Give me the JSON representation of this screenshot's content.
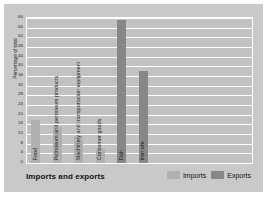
{
  "chart_data": {
    "type": "bar",
    "title": "Imports and exports",
    "xlabel": "",
    "ylabel": "Percentage of total",
    "ylim": [
      0,
      60
    ],
    "grid": true,
    "legend_position": "bottom-right",
    "categories": [
      "Food",
      "Petroleum and petroleum products",
      "Machinery and transportation equipment",
      "Consumer goods",
      "Fish",
      "Iron ore"
    ],
    "series": [
      {
        "name": "Imports",
        "color": "#b0b0b0",
        "values": [
          18,
          15,
          11,
          6,
          null,
          null
        ]
      },
      {
        "name": "Exports",
        "color": "#878787",
        "values": [
          null,
          null,
          null,
          null,
          59,
          38
        ]
      }
    ],
    "bars": [
      {
        "category": "Food",
        "series": "Imports",
        "value": 18
      },
      {
        "category": "Petroleum and petroleum products",
        "series": "Imports",
        "value": 15
      },
      {
        "category": "Machinery and transportation equipment",
        "series": "Imports",
        "value": 11
      },
      {
        "category": "Consumer goods",
        "series": "Imports",
        "value": 6
      },
      {
        "category": "Fish",
        "series": "Exports",
        "value": 59
      },
      {
        "category": "Iron ore",
        "series": "Exports",
        "value": 38
      }
    ],
    "yticks": [
      0,
      4,
      8,
      12,
      16,
      20,
      24,
      28,
      32,
      36,
      40,
      44,
      48,
      52,
      56,
      60
    ],
    "ytick_labels": [
      "0",
      "4",
      "8",
      "12",
      "16",
      "20",
      "24",
      "28",
      "32",
      "36",
      "40",
      "44",
      "48",
      "52",
      "56",
      "60"
    ]
  },
  "legend": {
    "items": [
      {
        "label": "Imports",
        "color": "#b0b0b0"
      },
      {
        "label": "Exports",
        "color": "#878787"
      }
    ]
  },
  "colors": {
    "panel_background": "#c9c9c9",
    "plot_background": "#c2c2c2",
    "gridline": "#ffffff",
    "imports": "#b0b0b0",
    "exports": "#878787",
    "text": "#111111"
  }
}
